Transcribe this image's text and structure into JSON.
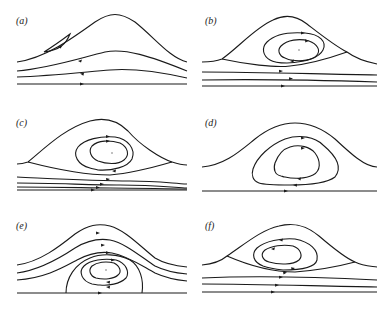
{
  "figure": {
    "stroke_color": "#1a1a1a",
    "background": "#ffffff",
    "panels": [
      {
        "id": "a",
        "label": "(a)"
      },
      {
        "id": "b",
        "label": "(b)"
      },
      {
        "id": "c",
        "label": "(c)"
      },
      {
        "id": "d",
        "label": "(d)"
      },
      {
        "id": "e",
        "label": "(e)"
      },
      {
        "id": "f",
        "label": "(f)"
      }
    ]
  }
}
